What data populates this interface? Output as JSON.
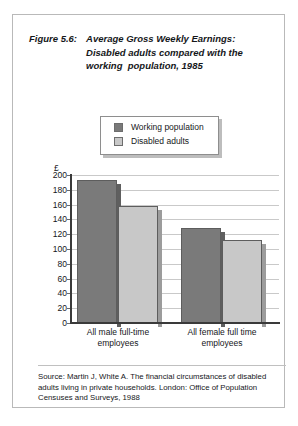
{
  "figure": {
    "number_label": "Figure 5.6:",
    "title_lines": [
      "Average Gross Weekly Earnings:",
      "Disabled adults compared with the",
      "working  population, 1985"
    ]
  },
  "legend": {
    "items": [
      {
        "label": "Working population",
        "color": "#7a7a7a"
      },
      {
        "label": "Disabled adults",
        "color": "#c8c8c8"
      }
    ]
  },
  "source": {
    "lines": [
      "Source: Martin J, White A. The financial circumstances of disabled",
      "adults living in private households. London: Office of Population",
      "Censuses and Surveys, 1988"
    ]
  },
  "chart_data": {
    "type": "bar",
    "title": "Average Gross Weekly Earnings: Disabled adults compared with the working population, 1985",
    "xlabel": "",
    "ylabel": "£",
    "unit_symbol": "£",
    "ylim": [
      0,
      200
    ],
    "ytick_step": 20,
    "yticks": [
      0,
      20,
      40,
      60,
      80,
      100,
      120,
      140,
      160,
      180,
      200
    ],
    "grid": true,
    "legend_position": "above-plot",
    "categories": [
      "All male full-time employees",
      "All female full time employees"
    ],
    "category_label_lines": [
      [
        "All male full-time",
        "employees"
      ],
      [
        "All female full time",
        "employees"
      ]
    ],
    "series": [
      {
        "name": "Working population",
        "color": "#7a7a7a",
        "values": [
          193,
          128
        ]
      },
      {
        "name": "Disabled adults",
        "color": "#c8c8c8",
        "values": [
          158,
          112
        ]
      }
    ]
  }
}
